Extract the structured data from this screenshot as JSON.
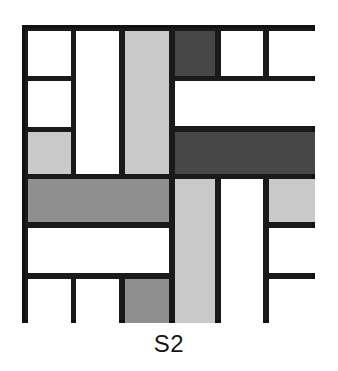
{
  "figure": {
    "caption": "S2",
    "type": "mosaic-block-diagram",
    "canvas": {
      "width": 338,
      "height": 371,
      "background": "#ffffff"
    },
    "square": {
      "left": 22,
      "top": 25,
      "width": 293,
      "height": 298,
      "border_color": "#111111",
      "border_width": 3,
      "grout_color": "#1a1a1a"
    },
    "palette": {
      "white": "#ffffff",
      "light_gray": "#c9c9c9",
      "mid_gray": "#8f8f8f",
      "dark_gray": "#474747",
      "line": "#111111"
    },
    "grid": {
      "column_edges": [
        22,
        70,
        119,
        169,
        215,
        263,
        315
      ],
      "row_edges": [
        25,
        75,
        126,
        173,
        222,
        273,
        323
      ]
    },
    "tiles": [
      {
        "name": "tile-r1c1",
        "x": 25,
        "y": 28,
        "w": 43,
        "h": 45,
        "fill": "white"
      },
      {
        "name": "tile-r2c1",
        "x": 25,
        "y": 78,
        "w": 43,
        "h": 46,
        "fill": "white"
      },
      {
        "name": "tile-r3c1",
        "x": 25,
        "y": 129,
        "w": 43,
        "h": 42,
        "fill": "light_gray"
      },
      {
        "name": "tile-col2-tall",
        "x": 73,
        "y": 28,
        "w": 43,
        "h": 143,
        "fill": "white"
      },
      {
        "name": "tile-col3-tall",
        "x": 122,
        "y": 28,
        "w": 44,
        "h": 143,
        "fill": "light_gray"
      },
      {
        "name": "tile-r1c4-dark",
        "x": 172,
        "y": 28,
        "w": 40,
        "h": 45,
        "fill": "dark_gray"
      },
      {
        "name": "tile-r1c5",
        "x": 218,
        "y": 28,
        "w": 42,
        "h": 45,
        "fill": "white"
      },
      {
        "name": "tile-r1c6",
        "x": 266,
        "y": 28,
        "w": 46,
        "h": 45,
        "fill": "white"
      },
      {
        "name": "tile-r2-right-wide",
        "x": 172,
        "y": 78,
        "w": 140,
        "h": 45,
        "fill": "white"
      },
      {
        "name": "tile-r3-right-dark",
        "x": 172,
        "y": 129,
        "w": 140,
        "h": 42,
        "fill": "dark_gray"
      },
      {
        "name": "tile-r4-left-mid",
        "x": 25,
        "y": 176,
        "w": 141,
        "h": 43,
        "fill": "mid_gray"
      },
      {
        "name": "tile-r5-left-wide",
        "x": 25,
        "y": 225,
        "w": 141,
        "h": 45,
        "fill": "white"
      },
      {
        "name": "tile-r6c1",
        "x": 25,
        "y": 276,
        "w": 43,
        "h": 44,
        "fill": "white"
      },
      {
        "name": "tile-r6c2",
        "x": 73,
        "y": 276,
        "w": 43,
        "h": 44,
        "fill": "white"
      },
      {
        "name": "tile-r6c3-mid",
        "x": 122,
        "y": 276,
        "w": 44,
        "h": 44,
        "fill": "mid_gray"
      },
      {
        "name": "tile-col4-tall-light",
        "x": 172,
        "y": 176,
        "w": 40,
        "h": 144,
        "fill": "light_gray"
      },
      {
        "name": "tile-col5-tall",
        "x": 218,
        "y": 176,
        "w": 42,
        "h": 144,
        "fill": "white"
      },
      {
        "name": "tile-r4c6-light",
        "x": 266,
        "y": 176,
        "w": 46,
        "h": 43,
        "fill": "light_gray"
      },
      {
        "name": "tile-r5c6",
        "x": 266,
        "y": 225,
        "w": 46,
        "h": 45,
        "fill": "white"
      },
      {
        "name": "tile-r6c6",
        "x": 266,
        "y": 276,
        "w": 46,
        "h": 44,
        "fill": "white"
      }
    ]
  }
}
